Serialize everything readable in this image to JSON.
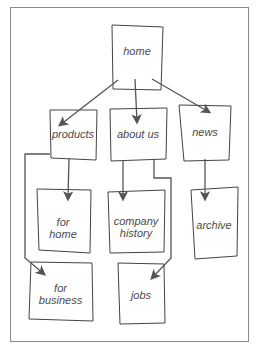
{
  "diagram": {
    "type": "sitemap",
    "style": "hand-drawn wireframe",
    "stroke_color": "#555555",
    "nodes": [
      {
        "id": "home",
        "label": "home",
        "x": 111,
        "y": 24,
        "w": 52,
        "h": 67
      },
      {
        "id": "products",
        "label": "products",
        "x": 49,
        "y": 108,
        "w": 48,
        "h": 51
      },
      {
        "id": "about",
        "label": "about us",
        "x": 109,
        "y": 108,
        "w": 58,
        "h": 52
      },
      {
        "id": "news",
        "label": "news",
        "x": 178,
        "y": 104,
        "w": 52,
        "h": 56
      },
      {
        "id": "forhome",
        "label": "for home",
        "x": 36,
        "y": 188,
        "w": 54,
        "h": 64
      },
      {
        "id": "history",
        "label": "company history",
        "x": 107,
        "y": 190,
        "w": 58,
        "h": 62
      },
      {
        "id": "archive",
        "label": "archive",
        "x": 190,
        "y": 188,
        "w": 48,
        "h": 71
      },
      {
        "id": "business",
        "label": "for business",
        "x": 28,
        "y": 262,
        "w": 65,
        "h": 58
      },
      {
        "id": "jobs",
        "label": "jobs",
        "x": 117,
        "y": 262,
        "w": 48,
        "h": 62
      }
    ],
    "edges": [
      {
        "from": "home",
        "to": "products"
      },
      {
        "from": "home",
        "to": "about"
      },
      {
        "from": "home",
        "to": "news"
      },
      {
        "from": "products",
        "to": "forhome"
      },
      {
        "from": "products",
        "to": "business"
      },
      {
        "from": "about",
        "to": "history"
      },
      {
        "from": "about",
        "to": "jobs"
      },
      {
        "from": "news",
        "to": "archive"
      }
    ]
  }
}
